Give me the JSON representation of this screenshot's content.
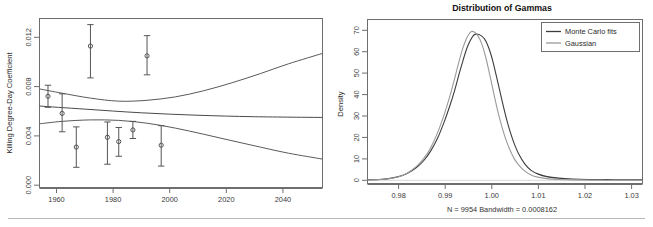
{
  "chart_data": [
    {
      "type": "scatter",
      "panel": "left",
      "title": "",
      "xlabel": "",
      "ylabel": "Killing Degree-Day Coefficient",
      "xlim": [
        1954,
        2054
      ],
      "ylim": [
        0.0,
        0.0138
      ],
      "xticks": [
        1960,
        1980,
        2000,
        2020,
        2040
      ],
      "xtick_labels": [
        "1960",
        "1980",
        "2000",
        "2020",
        "2040"
      ],
      "yticks": [
        0.0,
        0.004,
        0.008,
        0.012
      ],
      "ytick_labels": [
        "0.000",
        "0.004",
        "0.008",
        "0.012"
      ],
      "grid": false,
      "legend": "none",
      "points": [
        {
          "x": 1957,
          "y": 0.00745,
          "ylo": 0.00655,
          "yhi": 0.00835
        },
        {
          "x": 1962,
          "y": 0.00605,
          "ylo": 0.00455,
          "yhi": 0.00765
        },
        {
          "x": 1967,
          "y": 0.0033,
          "ylo": 0.00165,
          "yhi": 0.00495
        },
        {
          "x": 1972,
          "y": 0.01155,
          "ylo": 0.00895,
          "yhi": 0.0133
        },
        {
          "x": 1978,
          "y": 0.0041,
          "ylo": 0.0019,
          "yhi": 0.00535
        },
        {
          "x": 1982,
          "y": 0.00375,
          "ylo": 0.00255,
          "yhi": 0.0049
        },
        {
          "x": 1987,
          "y": 0.0047,
          "ylo": 0.004,
          "yhi": 0.0054
        },
        {
          "x": 1992,
          "y": 0.01075,
          "ylo": 0.0092,
          "yhi": 0.0124
        },
        {
          "x": 1997,
          "y": 0.00345,
          "ylo": 0.00175,
          "yhi": 0.00505
        }
      ],
      "fit_line": {
        "name": "trend fit",
        "x": [
          1954,
          1970,
          1990,
          2010,
          2030,
          2054
        ],
        "y": [
          0.00665,
          0.0064,
          0.0061,
          0.0059,
          0.00578,
          0.00572
        ]
      },
      "confidence_band_upper": {
        "x": [
          1954,
          1962,
          1972,
          1982,
          1992,
          2002,
          2012,
          2022,
          2032,
          2042,
          2054
        ],
        "y": [
          0.00805,
          0.0077,
          0.0073,
          0.00705,
          0.00712,
          0.0074,
          0.0079,
          0.00855,
          0.0093,
          0.0101,
          0.01095
        ]
      },
      "confidence_band_lower": {
        "x": [
          1954,
          1962,
          1972,
          1982,
          1992,
          2002,
          2012,
          2022,
          2032,
          2042,
          2054
        ],
        "y": [
          0.0052,
          0.0054,
          0.00552,
          0.00548,
          0.00525,
          0.00485,
          0.00435,
          0.00382,
          0.0033,
          0.0028,
          0.00232
        ]
      }
    },
    {
      "type": "line",
      "panel": "right",
      "title": "Distribution of Gammas",
      "xlabel": "N = 9954  Bandwidth = 0.0008162",
      "ylabel": "Density",
      "xlim": [
        0.9735,
        1.0325
      ],
      "ylim": [
        0,
        72
      ],
      "xticks": [
        0.98,
        0.99,
        1.0,
        1.01,
        1.02,
        1.03
      ],
      "xtick_labels": [
        "0.98",
        "0.99",
        "1.00",
        "1.01",
        "1.02",
        "1.03"
      ],
      "yticks": [
        0,
        10,
        20,
        30,
        40,
        50,
        60,
        70
      ],
      "ytick_labels": [
        "0",
        "10",
        "20",
        "30",
        "40",
        "50",
        "60",
        "70"
      ],
      "grid": false,
      "legend_position": "top-right",
      "legend_entries": [
        "Monte Carlo fits",
        "Gaussian"
      ],
      "series": [
        {
          "name": "Monte Carlo fits",
          "color": "#3d3d3d",
          "x": [
            0.9735,
            0.976,
            0.978,
            0.98,
            0.982,
            0.984,
            0.9855,
            0.987,
            0.9885,
            0.99,
            0.9912,
            0.9922,
            0.9932,
            0.994,
            0.9948,
            0.9955,
            0.9962,
            0.9968,
            0.9974,
            0.998,
            0.9986,
            0.9992,
            0.9998,
            1.0004,
            1.001,
            1.0018,
            1.0026,
            1.0034,
            1.0042,
            1.005,
            1.006,
            1.0072,
            1.0086,
            1.01,
            1.012,
            1.0145,
            1.0175,
            1.021,
            1.025,
            1.029,
            1.0325
          ],
          "y": [
            0.2,
            0.4,
            0.8,
            1.6,
            3.2,
            6.0,
            9.0,
            13.5,
            19.5,
            27.5,
            35.0,
            42.0,
            50.0,
            56.0,
            61.5,
            65.0,
            67.5,
            68.2,
            68.0,
            67.3,
            66.0,
            63.5,
            60.0,
            55.5,
            50.0,
            42.5,
            35.0,
            28.0,
            22.0,
            17.0,
            12.0,
            7.8,
            4.6,
            3.0,
            1.7,
            1.0,
            0.6,
            0.4,
            0.3,
            0.25,
            0.2
          ]
        },
        {
          "name": "Gaussian",
          "color": "#9a9a9a",
          "x": [
            0.9735,
            0.976,
            0.978,
            0.98,
            0.982,
            0.984,
            0.9855,
            0.987,
            0.9885,
            0.99,
            0.9912,
            0.9922,
            0.9932,
            0.994,
            0.9946,
            0.9952,
            0.9958,
            0.9964,
            0.997,
            0.9976,
            0.9982,
            0.9988,
            0.9994,
            1.0,
            1.0008,
            1.0016,
            1.0024,
            1.0032,
            1.004,
            1.005,
            1.006,
            1.0072,
            1.0086,
            1.01,
            1.012,
            1.0145,
            1.0175,
            1.021,
            1.025,
            1.029,
            1.0325
          ],
          "y": [
            0.1,
            0.3,
            0.7,
            1.5,
            3.3,
            6.5,
            10.0,
            15.0,
            22.0,
            31.0,
            39.5,
            47.5,
            56.0,
            62.0,
            65.5,
            68.0,
            69.4,
            69.2,
            68.0,
            65.8,
            62.5,
            58.0,
            52.5,
            46.5,
            38.5,
            31.0,
            24.5,
            19.0,
            14.5,
            10.0,
            7.0,
            4.4,
            2.5,
            1.5,
            0.8,
            0.4,
            0.2,
            0.1,
            0.05,
            0.05,
            0.05
          ]
        }
      ]
    }
  ],
  "left_panel": {
    "ylabel": "Killing Degree-Day Coefficient",
    "xtick_labels": [
      "1960",
      "1980",
      "2000",
      "2020",
      "2040"
    ],
    "ytick_labels": [
      "0.000",
      "0.004",
      "0.008",
      "0.012"
    ]
  },
  "right_panel": {
    "title": "Distribution of Gammas",
    "ylabel": "Density",
    "footer": "N = 9954  Bandwidth = 0.0008162",
    "xtick_labels": [
      "0.98",
      "0.99",
      "1.00",
      "1.01",
      "1.02",
      "1.03"
    ],
    "ytick_labels": [
      "0",
      "10",
      "20",
      "30",
      "40",
      "50",
      "60",
      "70"
    ],
    "legend": {
      "entries": [
        "Monte Carlo fits",
        "Gaussian"
      ]
    }
  },
  "colors": {
    "monte_carlo": "#3d3d3d",
    "gaussian": "#9a9a9a",
    "frame": "#6e6e6e",
    "text": "#2b2b2b"
  }
}
